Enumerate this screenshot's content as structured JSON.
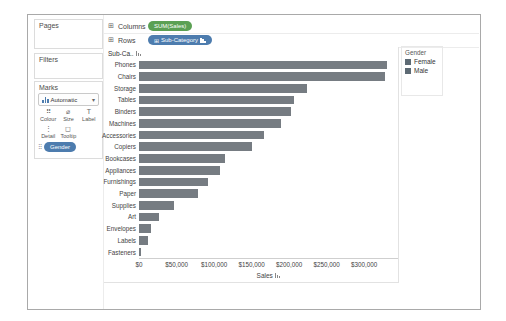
{
  "colors": {
    "measure_pill": "#5ba053",
    "dimension_pill": "#4d7cae",
    "bar": "#767c82"
  },
  "icons": {
    "grid": "⊞",
    "caret": "▾",
    "colour": "⠿",
    "size": "⌀",
    "label": "T",
    "detail": "⋮",
    "tooltip": "◻"
  },
  "shelves": {
    "columns": {
      "label": "Columns",
      "pill": "SUM(Sales)"
    },
    "rows": {
      "label": "Rows",
      "pill": "Sub-Category"
    }
  },
  "sidebar": {
    "pages_label": "Pages",
    "filters_label": "Filters",
    "marks": {
      "title": "Marks",
      "mark_type": "Automatic",
      "buttons": [
        {
          "label": "Colour",
          "icon": "colour-icon"
        },
        {
          "label": "Size",
          "icon": "size-icon"
        },
        {
          "label": "Label",
          "icon": "label-icon"
        },
        {
          "label": "Detail",
          "icon": "detail-icon"
        },
        {
          "label": "Tooltip",
          "icon": "tooltip-icon"
        }
      ],
      "pill": "Gender"
    }
  },
  "legend": {
    "title": "Gender",
    "items": [
      {
        "label": "Female",
        "color": "#5d6a74"
      },
      {
        "label": "Male",
        "color": "#5d6a74"
      }
    ]
  },
  "chart_data": {
    "type": "bar",
    "orientation": "horizontal",
    "title": "",
    "row_header": "Sub-Ca..",
    "categories": [
      "Phones",
      "Chairs",
      "Storage",
      "Tables",
      "Binders",
      "Machines",
      "Accessories",
      "Copiers",
      "Bookcases",
      "Appliances",
      "Furnishings",
      "Paper",
      "Supplies",
      "Art",
      "Envelopes",
      "Labels",
      "Fasteners"
    ],
    "values": [
      330000,
      328000,
      224000,
      207000,
      203000,
      189000,
      167000,
      150000,
      115000,
      108000,
      92000,
      78000,
      47000,
      27000,
      16500,
      12500,
      3000
    ],
    "xlabel": "Sales",
    "ylabel": "Sub-Category",
    "xlim": [
      0,
      345000
    ],
    "grid": false,
    "legend_position": "right",
    "x_ticks": [
      {
        "value": 0,
        "label": "$0"
      },
      {
        "value": 50000,
        "label": "$50,000"
      },
      {
        "value": 100000,
        "label": "$100,000"
      },
      {
        "value": 150000,
        "label": "$150,000"
      },
      {
        "value": 200000,
        "label": "$200,000"
      },
      {
        "value": 250000,
        "label": "$250,000"
      },
      {
        "value": 300000,
        "label": "$300,000"
      }
    ]
  }
}
